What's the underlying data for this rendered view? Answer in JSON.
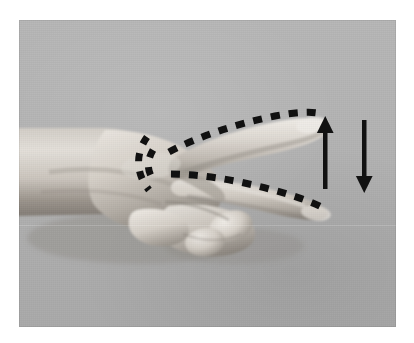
{
  "figure": {
    "caption": "",
    "background_color": "#ffffff",
    "plate": {
      "background_color": "#b3b3b3",
      "left": 19,
      "top": 20,
      "width": 377,
      "height": 307
    }
  },
  "photo": {
    "subject": "human left hand extended from the left edge, palm side down, index and middle fingers extended to the right in a V shape, remaining fingers and thumb curled into a fist",
    "orientation": "fingers point right",
    "color_mode": "grayscale",
    "skin_tone_highlight": "#e6e2dc",
    "skin_tone_midtone": "#c9c3ba",
    "skin_tone_shadow": "#8f8a83"
  },
  "annotations": {
    "ink_color": "#111111",
    "dashed_lines": [
      {
        "name": "index-finger-axis",
        "label": "dashed line along upper (index) finger",
        "dash_count": 11,
        "start": {
          "x": 165,
          "y": 152
        },
        "end": {
          "x": 306,
          "y": 121
        }
      },
      {
        "name": "middle-finger-axis",
        "label": "dashed line along lower (middle) finger",
        "dash_count": 11,
        "start": {
          "x": 170,
          "y": 168
        },
        "end": {
          "x": 308,
          "y": 187
        }
      },
      {
        "name": "knuckle-angle-arc",
        "label": "dashed arc marking the angle between the two fingers at the knuckle",
        "dash_count": 7
      }
    ],
    "arrows": [
      {
        "name": "up-arrow",
        "direction": "up",
        "meaning": "finger raises",
        "x": 325,
        "y_top": 118,
        "y_bottom": 181,
        "shaft_width": 4,
        "head_width": 16,
        "head_height": 14
      },
      {
        "name": "down-arrow",
        "direction": "down",
        "meaning": "finger lowers",
        "x": 364,
        "y_top": 120,
        "y_bottom": 186,
        "shaft_width": 4,
        "head_width": 16,
        "head_height": 14
      }
    ]
  }
}
